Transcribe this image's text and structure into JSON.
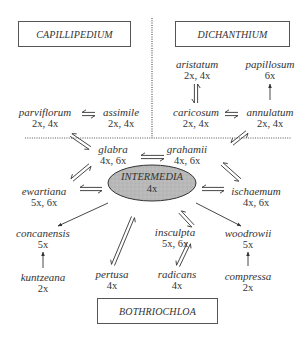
{
  "genera": {
    "capillipedium": "CAPILLIPEDIUM",
    "dichanthium": "DICHANTHIUM",
    "bothriochloa": "BOTHRIOCHLOA"
  },
  "center": {
    "name": "INTERMEDIA",
    "ploidy": "4x",
    "fill": "#b5b5b5"
  },
  "nodes": {
    "parviflorum": {
      "name": "parviflorum",
      "ploidy": "2x, 4x"
    },
    "assimile": {
      "name": "assimile",
      "ploidy": "2x, 4x"
    },
    "aristatum": {
      "name": "aristatum",
      "ploidy": "2x, 4x"
    },
    "papillosum": {
      "name": "papillosum",
      "ploidy": "6x"
    },
    "caricosum": {
      "name": "caricosum",
      "ploidy": "2x, 4x"
    },
    "annulatum": {
      "name": "annulatum",
      "ploidy": "2x, 4x"
    },
    "glabra": {
      "name": "glabra",
      "ploidy": "4x, 6x"
    },
    "grahamii": {
      "name": "grahamii",
      "ploidy": "4x, 6x"
    },
    "ewartiana": {
      "name": "ewartiana",
      "ploidy": "5x, 6x"
    },
    "ischaemum": {
      "name": "ischaemum",
      "ploidy": "4x, 6x"
    },
    "concanensis": {
      "name": "concanensis",
      "ploidy": "5x"
    },
    "kuntzeana": {
      "name": "kuntzeana",
      "ploidy": "2x"
    },
    "pertusa": {
      "name": "pertusa",
      "ploidy": "4x"
    },
    "insculpta": {
      "name": "insculpta",
      "ploidy": "5x, 6x"
    },
    "radicans": {
      "name": "radicans",
      "ploidy": "4x"
    },
    "woodrowii": {
      "name": "woodrowii",
      "ploidy": "5x"
    },
    "compressa": {
      "name": "compressa",
      "ploidy": "2x"
    }
  },
  "relations": [
    {
      "from": "parviflorum",
      "to": "assimile",
      "type": "reversible"
    },
    {
      "from": "aristatum",
      "to": "caricosum",
      "type": "reversible"
    },
    {
      "from": "caricosum",
      "to": "annulatum",
      "type": "reversible"
    },
    {
      "from": "annulatum",
      "to": "papillosum",
      "type": "one-way"
    },
    {
      "from": "parviflorum",
      "to": "glabra",
      "type": "reversible"
    },
    {
      "from": "annulatum",
      "to": "grahamii",
      "type": "reversible"
    },
    {
      "from": "glabra",
      "to": "grahamii",
      "type": "reversible"
    },
    {
      "from": "glabra",
      "to": "ewartiana",
      "type": "reversible"
    },
    {
      "from": "grahamii",
      "to": "ischaemum",
      "type": "reversible"
    },
    {
      "from": "ewartiana",
      "to": "intermedia",
      "type": "reversible"
    },
    {
      "from": "intermedia",
      "to": "ischaemum",
      "type": "reversible"
    },
    {
      "from": "intermedia",
      "to": "concanensis",
      "type": "one-way"
    },
    {
      "from": "kuntzeana",
      "to": "concanensis",
      "type": "one-way"
    },
    {
      "from": "intermedia",
      "to": "pertusa",
      "type": "reversible"
    },
    {
      "from": "intermedia",
      "to": "insculpta",
      "type": "reversible"
    },
    {
      "from": "insculpta",
      "to": "radicans",
      "type": "reversible"
    },
    {
      "from": "intermedia",
      "to": "woodrowii",
      "type": "one-way"
    },
    {
      "from": "compressa",
      "to": "woodrowii",
      "type": "one-way"
    }
  ],
  "colors": {
    "line": "#333333",
    "dotted": "#555555"
  }
}
